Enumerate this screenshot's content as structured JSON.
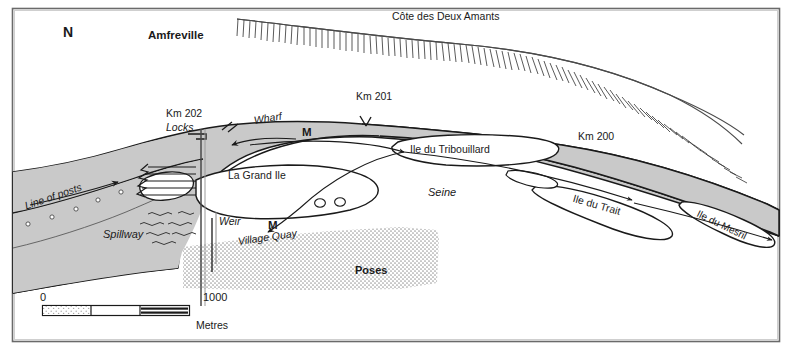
{
  "figure": {
    "kind": "map",
    "frame": {
      "x": 12,
      "y": 8,
      "width": 768,
      "height": 334,
      "border_color": "#555555"
    },
    "colors": {
      "water_fill": "#c9c9c9",
      "water_outline": "#1a1a1a",
      "island_fill": "#ffffff",
      "settlement_stipple": "#b4b4b4",
      "text": "#1a1a1a",
      "paper": "#ffffff",
      "hachure": "#3c3c3c"
    }
  },
  "compass": {
    "label": "N",
    "points": 16,
    "center": {
      "x": 77,
      "y": 85
    },
    "radius": 47,
    "hub_radius": 9
  },
  "labels": {
    "settlement_amfreville": "Amfreville",
    "escarpment": "Côte des Deux Amants",
    "km202": "Km 202",
    "km201": "Km 201",
    "km200": "Km 200",
    "locks": "Locks",
    "wharf": "Wharf",
    "weir": "Weir",
    "spillway": "Spillway",
    "line_of_posts": "Line of posts",
    "village_quay": "Village Quay",
    "settlement_poses": "Poses",
    "river": "Seine",
    "island_grand_ile": "La Grand Ile",
    "island_tribouillard": "Ile du Tribouillard",
    "island_trait": "Ile du Trait",
    "island_mesril": "Ile du Mesril",
    "marker_m_upper": "M",
    "marker_m_lower": "M"
  },
  "scale_bar": {
    "min_label": "0",
    "max_label": "1000",
    "units_label": "Metres",
    "segments": 3,
    "x": 42,
    "y": 305,
    "width": 148,
    "height": 11
  },
  "map_features": {
    "islands": [
      {
        "name": "La Grand Ile",
        "label_rotation": 0
      },
      {
        "name": "Ile du Tribouillard",
        "label_rotation": 0
      },
      {
        "name": "Ile du Trait",
        "label_rotation": 16
      },
      {
        "name": "Ile du Mesril",
        "label_rotation": 26
      }
    ],
    "flow_arrows": 4,
    "islets": 2,
    "lock_chambers": 4,
    "posts": 7
  },
  "caption_fragment": " "
}
